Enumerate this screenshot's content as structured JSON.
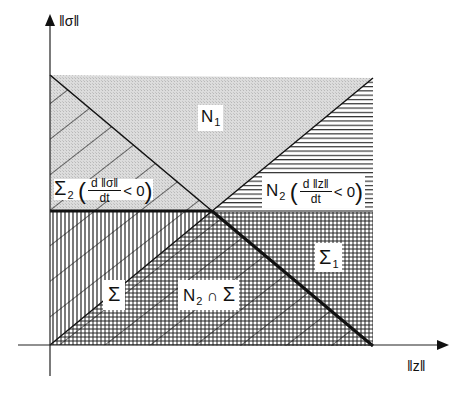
{
  "diagram": {
    "axes": {
      "y_label": "‖σ‖",
      "x_label": "‖z‖"
    },
    "regions": {
      "N1": {
        "symbol": "N",
        "sub": "1"
      },
      "Sigma2": {
        "symbol": "Σ",
        "sub": "2",
        "frac_num": "d ‖σ‖",
        "frac_den": "dt",
        "relation": "< 0"
      },
      "N2": {
        "symbol": "N",
        "sub": "2",
        "frac_num": "d ‖z‖",
        "frac_den": "dt",
        "relation": "< 0"
      },
      "Sigma1": {
        "symbol": "Σ",
        "sub": "1"
      },
      "Sigma": {
        "symbol": "Σ"
      },
      "N2capSigma": {
        "symbol": "N",
        "sub": "2",
        "op": "∩",
        "symbol2": "Σ"
      }
    },
    "colors": {
      "ink": "#111111",
      "stipple": "#d4d4d4",
      "background": "#ffffff"
    }
  }
}
